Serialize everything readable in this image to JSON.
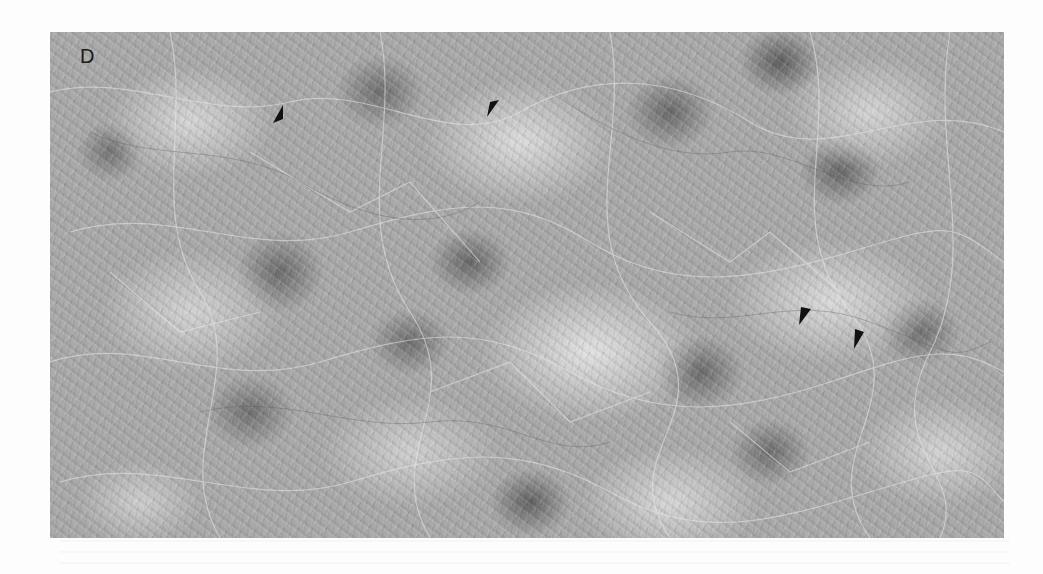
{
  "figure": {
    "panel_label": "D",
    "arrowheads": [
      {
        "id": 1,
        "x": 278,
        "y": 115,
        "direction": "points-down-left"
      },
      {
        "id": 2,
        "x": 492,
        "y": 108,
        "direction": "points-down-left"
      },
      {
        "id": 3,
        "x": 804,
        "y": 316,
        "direction": "points-down-left"
      },
      {
        "id": 4,
        "x": 858,
        "y": 338,
        "direction": "points-down-left"
      }
    ],
    "colors": {
      "background": "#fdfdfd",
      "micrograph_base": "#a9a9a9",
      "arrowhead": "#111111",
      "label": "#1a1a1a"
    }
  }
}
